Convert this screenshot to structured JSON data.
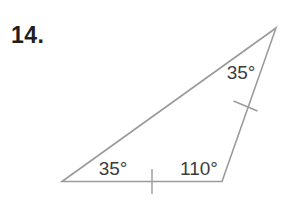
{
  "problem_number": "14.",
  "figure": {
    "type": "triangle-angle-diagram",
    "angle_labels": {
      "apex": "35°",
      "bottom_left": "35°",
      "bottom_right": "110°"
    },
    "tick_marks": [
      "bottom-side-tick",
      "right-side-tick"
    ],
    "colors": {
      "line": "#9b9b9b",
      "angle_text": "#3d3d3d"
    }
  }
}
